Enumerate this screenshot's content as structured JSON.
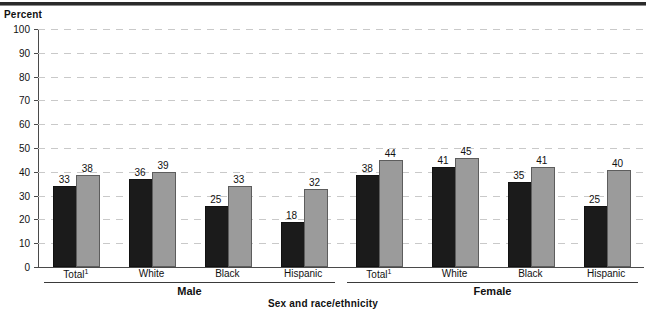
{
  "chart_data": {
    "type": "bar",
    "title": "",
    "xlabel": "Sex and race/ethnicity",
    "ylabel": "Percent",
    "ylim": [
      0,
      100
    ],
    "ytick_step": 10,
    "yticks": [
      "0",
      "10",
      "20",
      "30",
      "40",
      "50",
      "60",
      "70",
      "80",
      "90",
      "100"
    ],
    "grid": true,
    "legend_position": "none",
    "categories": [
      "Total",
      "White",
      "Black",
      "Hispanic",
      "Total",
      "White",
      "Black",
      "Hispanic"
    ],
    "category_footnote_marker": "1",
    "groups": [
      {
        "label": "Male",
        "categories": [
          {
            "label": "Total",
            "footnote": "1",
            "dark": 33,
            "light": 38
          },
          {
            "label": "White",
            "footnote": "",
            "dark": 36,
            "light": 39
          },
          {
            "label": "Black",
            "footnote": "",
            "dark": 25,
            "light": 33
          },
          {
            "label": "Hispanic",
            "footnote": "",
            "dark": 18,
            "light": 32
          }
        ]
      },
      {
        "label": "Female",
        "categories": [
          {
            "label": "Total",
            "footnote": "1",
            "dark": 38,
            "light": 44
          },
          {
            "label": "White",
            "footnote": "",
            "dark": 41,
            "light": 45
          },
          {
            "label": "Black",
            "footnote": "",
            "dark": 35,
            "light": 41
          },
          {
            "label": "Hispanic",
            "footnote": "",
            "dark": 25,
            "light": 40
          }
        ]
      }
    ],
    "series": [
      {
        "name": "series-dark",
        "color": "#1b1b1b",
        "values": [
          33,
          36,
          25,
          18,
          38,
          41,
          35,
          25
        ]
      },
      {
        "name": "series-light",
        "color": "#9b9b9b",
        "values": [
          38,
          39,
          33,
          32,
          44,
          45,
          41,
          40
        ]
      }
    ]
  },
  "colors": {
    "dark_bar": "#1b1b1b",
    "light_bar": "#9b9b9b",
    "axis": "#4a4a4a",
    "grid": "#c9c9c9",
    "text": "#111111"
  }
}
